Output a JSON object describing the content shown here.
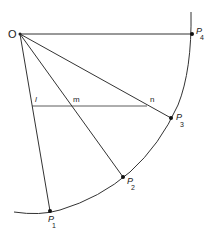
{
  "diagram": {
    "colors": {
      "stroke": "#333333",
      "text": "#222222",
      "background": "#ffffff"
    },
    "origin": {
      "label": "O",
      "x": 20,
      "y": 34
    },
    "points": [
      {
        "id": "P1",
        "letter": "P",
        "sub": "1",
        "x": 50,
        "y": 211
      },
      {
        "id": "P2",
        "letter": "P",
        "sub": "2",
        "x": 123,
        "y": 177
      },
      {
        "id": "P3",
        "letter": "P",
        "sub": "3",
        "x": 171,
        "y": 118
      },
      {
        "id": "P4",
        "letter": "P",
        "sub": "4",
        "x": 192,
        "y": 34
      }
    ],
    "chord": {
      "y": 106,
      "labels": {
        "l": "l",
        "m": "m",
        "n": "n"
      }
    }
  }
}
